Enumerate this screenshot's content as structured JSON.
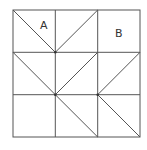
{
  "diagram": {
    "grid": {
      "rows": 3,
      "cols": 3,
      "x0": 13,
      "y0": 10,
      "cell": 42.3
    },
    "labels": {
      "A": "A",
      "B": "B"
    },
    "stroke_color": "#555555",
    "diagonals": [
      {
        "cell": [
          0,
          0
        ],
        "dir": "tl-br"
      },
      {
        "cell": [
          1,
          0
        ],
        "dir": "bl-tr"
      },
      {
        "cell": [
          0,
          1
        ],
        "dir": "tl-br"
      },
      {
        "cell": [
          1,
          1
        ],
        "dir": "bl-tr"
      },
      {
        "cell": [
          2,
          1
        ],
        "dir": "bl-tr"
      },
      {
        "cell": [
          1,
          2
        ],
        "dir": "tl-br"
      },
      {
        "cell": [
          2,
          2
        ],
        "dir": "tl-br"
      }
    ]
  }
}
